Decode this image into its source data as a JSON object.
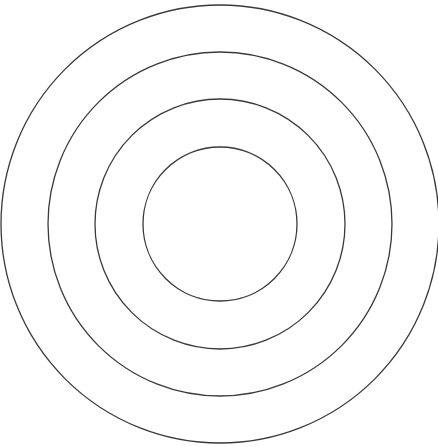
{
  "diagram": {
    "type": "concentric-circles",
    "background": "#ffffff",
    "stroke_color": "#3a3a3a",
    "stroke_width": 1.3,
    "center": {
      "x": 220,
      "y": 224
    },
    "circles": [
      {
        "name": "ring-outer",
        "r": 219
      },
      {
        "name": "ring-third",
        "r": 172
      },
      {
        "name": "ring-second",
        "r": 125
      },
      {
        "name": "ring-inner",
        "r": 77
      }
    ]
  }
}
